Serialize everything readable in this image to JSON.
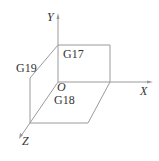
{
  "diagram": {
    "axes": {
      "x_label": "X",
      "y_label": "Y",
      "z_label": "Z",
      "origin_label": "O"
    },
    "planes": {
      "xy": "G17",
      "zx": "G18",
      "yz": "G19"
    },
    "colors": {
      "line": "#9a9a9a",
      "text": "#333333",
      "background": "#ffffff"
    }
  }
}
